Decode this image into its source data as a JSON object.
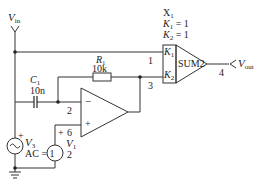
{
  "diagram": {
    "type": "circuit-schematic",
    "input_label": "V",
    "input_sub": "in",
    "output_label": "V",
    "output_sub": "out",
    "summer": {
      "ref": "X",
      "ref_sub": "1",
      "k1_label": "K",
      "k1_sub": "1",
      "k1_value": "= 1",
      "k2_label": "K",
      "k2_sub": "2",
      "k2_value": "= 1",
      "block_name": "SUM2",
      "port1": "K",
      "port1_sub": "1",
      "port2": "K",
      "port2_sub": "2"
    },
    "resistor": {
      "name": "R",
      "name_sub": "1",
      "value": "10k"
    },
    "capacitor": {
      "name": "C",
      "name_sub": "1",
      "value": "10n"
    },
    "opamp": {
      "inv": "−",
      "noninv": "+"
    },
    "source_v3": {
      "name": "V",
      "name_sub": "3",
      "ac": "AC = 1",
      "plus": "+"
    },
    "source_v1": {
      "name": "V",
      "name_sub": "1",
      "dc": "6",
      "plus": "+",
      "node": "2"
    },
    "nodes": {
      "n1": "1",
      "n2": "2",
      "n3": "3",
      "n4": "4"
    },
    "colors": {
      "wire": "#333333",
      "background": "#ffffff"
    }
  }
}
